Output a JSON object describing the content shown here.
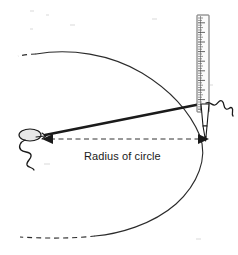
{
  "figure": {
    "title": "Drawing a circle with pin, string and pencil",
    "annotation": {
      "radius_label": "Radius of circle"
    },
    "icons": {
      "pin": "pin-icon",
      "pencil": "pencil-icon",
      "ruler": "ruler-icon",
      "string_left": "string-squiggle-icon",
      "string_right": "string-squiggle-icon",
      "arrow_left": "arrow-left-icon",
      "arrow_right": "arrow-right-icon"
    },
    "parts": {
      "arc_label": "circle arc",
      "arc_dashed_top_label": "arc continuation dashed top",
      "arc_dashed_bottom_label": "arc continuation dashed bottom",
      "radius_line_label": "radius dimension line",
      "string_label": "taut string from pin to pencil",
      "ruler_label": "ruler",
      "pin_label": "pin at circle centre",
      "pencil_label": "pencil at circle edge"
    },
    "colors": {
      "ink": "#1a1a1a",
      "arc": "#2b2b2b",
      "radius": "#333333",
      "ruler_fill": "#fbfbfb",
      "ruler_edge": "#555555",
      "background": "#ffffff"
    },
    "geometry": {
      "centre_x": 44,
      "centre_y": 136,
      "edge_x": 207,
      "edge_y": 136,
      "radius_px": 163,
      "ruler_top_y": 15,
      "ruler_bottom_y": 112,
      "ruler_x": 197,
      "ruler_width": 12,
      "ruler_tick_count": 40
    }
  }
}
